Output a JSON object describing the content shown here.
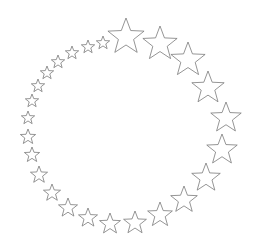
{
  "figure": {
    "background": "#ffffff",
    "stroke_color": "#7a7a7a",
    "fill_color": "#ffffff",
    "center": [
      129,
      131
    ],
    "stars": [
      {
        "x": 103,
        "y": 43,
        "r": 7
      },
      {
        "x": 88,
        "y": 47,
        "r": 7
      },
      {
        "x": 72,
        "y": 53,
        "r": 7
      },
      {
        "x": 58,
        "y": 62,
        "r": 7
      },
      {
        "x": 47,
        "y": 73,
        "r": 7
      },
      {
        "x": 38,
        "y": 86,
        "r": 7
      },
      {
        "x": 32,
        "y": 101,
        "r": 7
      },
      {
        "x": 28,
        "y": 118,
        "r": 7
      },
      {
        "x": 28,
        "y": 137,
        "r": 8
      },
      {
        "x": 32,
        "y": 155,
        "r": 8
      },
      {
        "x": 39,
        "y": 175,
        "r": 9
      },
      {
        "x": 52,
        "y": 193,
        "r": 9
      },
      {
        "x": 68,
        "y": 208,
        "r": 10
      },
      {
        "x": 88,
        "y": 218,
        "r": 10
      },
      {
        "x": 110,
        "y": 224,
        "r": 11
      },
      {
        "x": 135,
        "y": 223,
        "r": 12
      },
      {
        "x": 160,
        "y": 215,
        "r": 13
      },
      {
        "x": 184,
        "y": 200,
        "r": 14
      },
      {
        "x": 206,
        "y": 178,
        "r": 15
      },
      {
        "x": 222,
        "y": 150,
        "r": 16
      },
      {
        "x": 226,
        "y": 118,
        "r": 16
      },
      {
        "x": 208,
        "y": 88,
        "r": 17
      },
      {
        "x": 188,
        "y": 60,
        "r": 18
      },
      {
        "x": 160,
        "y": 44,
        "r": 18
      },
      {
        "x": 126,
        "y": 37,
        "r": 19
      }
    ]
  }
}
